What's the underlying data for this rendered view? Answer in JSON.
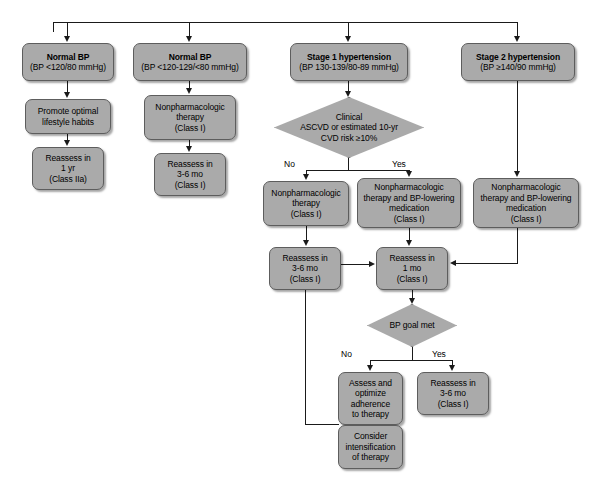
{
  "diagram": {
    "style": {
      "node_fill": "#aaaaaa",
      "node_border": "#5d5d5d",
      "line_color": "#1a1a1a",
      "background": "#ffffff"
    },
    "nodes": [
      {
        "id": "normal-bp",
        "type": "box",
        "lines": [
          "Normal BP",
          "(BP <120/80 mmHg)"
        ],
        "bold_first": true,
        "x": 22,
        "y": 43,
        "w": 92,
        "h": 38
      },
      {
        "id": "elevated-bp",
        "type": "box",
        "lines": [
          "Normal BP",
          "(BP <120-129/<80 mmHg)"
        ],
        "bold_first": true,
        "x": 133,
        "y": 43,
        "w": 114,
        "h": 38
      },
      {
        "id": "stage-1-hypertension",
        "type": "box",
        "lines": [
          "Stage 1 hypertension",
          "(BP 130-139/80-89 mmHg)"
        ],
        "bold_first": true,
        "x": 290,
        "y": 43,
        "w": 118,
        "h": 38
      },
      {
        "id": "stage-2-hypertension",
        "type": "box",
        "lines": [
          "Stage 2 hypertension",
          "(BP ≥140/90 mmHg)"
        ],
        "bold_first": true,
        "x": 461,
        "y": 43,
        "w": 114,
        "h": 38
      },
      {
        "id": "promote-lifestyle",
        "type": "box",
        "lines": [
          "Promote optimal",
          "lifestyle habits"
        ],
        "bold_first": false,
        "x": 25,
        "y": 99,
        "w": 86,
        "h": 35
      },
      {
        "id": "nonpharm-therapy-col2",
        "type": "box",
        "lines": [
          "Nonpharmacologic",
          "therapy",
          "(Class I)"
        ],
        "bold_first": false,
        "x": 144,
        "y": 95,
        "w": 92,
        "h": 45
      },
      {
        "id": "reassess-1yr",
        "type": "box",
        "lines": [
          "Reassess in",
          "1 yr",
          "(Class IIa)"
        ],
        "bold_first": false,
        "x": 32,
        "y": 147,
        "w": 72,
        "h": 43
      },
      {
        "id": "reassess-3-6mo-col2",
        "type": "box",
        "lines": [
          "Reassess in",
          "3-6 mo",
          "(Class I)"
        ],
        "bold_first": false,
        "x": 154,
        "y": 153,
        "w": 72,
        "h": 43
      },
      {
        "id": "clinical-ascvd-risk",
        "type": "diamond",
        "lines": [
          "Clinical",
          "ASCVD or estimated 10-yr",
          "CVD risk ≥10%"
        ],
        "x": 274,
        "y": 97,
        "w": 150,
        "h": 61
      },
      {
        "id": "nonpharm-therapy-no",
        "type": "box",
        "lines": [
          "Nonpharmacologic",
          "therapy",
          "(Class I)"
        ],
        "bold_first": false,
        "x": 263,
        "y": 181,
        "w": 86,
        "h": 45
      },
      {
        "id": "nonpharm-bp-lowering-yes",
        "type": "box",
        "lines": [
          "Nonpharmacologic",
          "therapy and BP-lowering",
          "medication",
          "(Class I)"
        ],
        "bold_first": false,
        "x": 357,
        "y": 178,
        "w": 104,
        "h": 50
      },
      {
        "id": "nonpharm-bp-lowering-stage2",
        "type": "box",
        "lines": [
          "Nonpharmacologic",
          "therapy and BP-lowering",
          "medication",
          "(Class I)"
        ],
        "bold_first": false,
        "x": 473,
        "y": 178,
        "w": 106,
        "h": 50
      },
      {
        "id": "reassess-3-6mo-mid",
        "type": "box",
        "lines": [
          "Reassess in",
          "3-6 mo",
          "(Class I)"
        ],
        "bold_first": false,
        "x": 269,
        "y": 247,
        "w": 72,
        "h": 43
      },
      {
        "id": "reassess-1mo",
        "type": "box",
        "lines": [
          "Reassess in",
          "1 mo",
          "(Class I)"
        ],
        "bold_first": false,
        "x": 376,
        "y": 247,
        "w": 72,
        "h": 43
      },
      {
        "id": "bp-goal-met",
        "type": "diamond",
        "lines": [
          "BP goal met"
        ],
        "x": 367,
        "y": 304,
        "w": 90,
        "h": 43
      },
      {
        "id": "assess-optimize-adherence",
        "type": "box",
        "lines": [
          "Assess and",
          "optimize",
          "adherence",
          "to therapy"
        ],
        "bold_first": false,
        "x": 338,
        "y": 372,
        "w": 65,
        "h": 53
      },
      {
        "id": "reassess-3-6mo-yes",
        "type": "box",
        "lines": [
          "Reassess in",
          "3-6 mo",
          "(Class I)"
        ],
        "bold_first": false,
        "x": 417,
        "y": 372,
        "w": 72,
        "h": 43
      },
      {
        "id": "consider-intensification",
        "type": "box",
        "lines": [
          "Consider",
          "intensification",
          "of therapy"
        ],
        "bold_first": false,
        "x": 338,
        "y": 425,
        "w": 65,
        "h": 44
      }
    ],
    "edge_labels": [
      {
        "id": "risk-no",
        "text": "No",
        "x": 284,
        "y": 159
      },
      {
        "id": "risk-yes",
        "text": "Yes",
        "x": 392,
        "y": 159
      },
      {
        "id": "goal-no",
        "text": "No",
        "x": 341,
        "y": 349
      },
      {
        "id": "goal-yes",
        "text": "Yes",
        "x": 432,
        "y": 349
      }
    ]
  }
}
